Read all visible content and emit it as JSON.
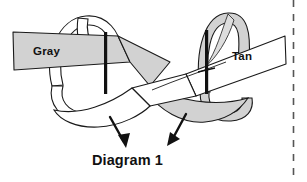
{
  "figure": {
    "caption": "Diagram 1",
    "labels": {
      "left_band": "Gray",
      "right_band": "Tan"
    },
    "icons": {
      "left_band_strip": "gray-ribbon-icon",
      "right_band_strip": "white-ribbon-icon",
      "left_loop": "white-loop-icon",
      "right_loop": "gray-loop-icon",
      "left_post": "vertical-black-bar-icon",
      "right_post": "vertical-black-bar-icon",
      "left_arrow": "down-left-arrow-icon",
      "right_arrow": "down-right-arrow-icon",
      "page_edge": "dashed-vertical-rule-icon"
    },
    "colors": {
      "gray_fill": "#d2d2d2",
      "gray_fill_dark": "#c3c3c3",
      "white_fill": "#ffffff",
      "stroke": "#1a1a1a",
      "text": "#111111",
      "background": "#ffffff",
      "dashed_rule": "#555555"
    }
  }
}
